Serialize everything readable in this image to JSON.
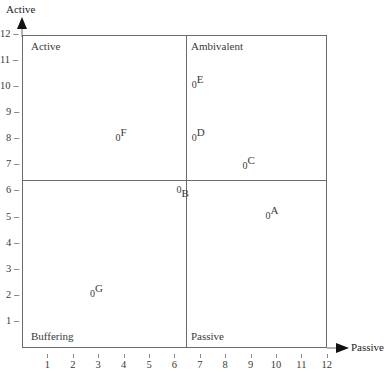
{
  "chart_data": {
    "type": "scatter",
    "title": "",
    "xlabel": "Passive",
    "ylabel": "Active",
    "xlim": [
      0,
      12
    ],
    "ylim": [
      0,
      12
    ],
    "x_ticks": [
      "1",
      "2",
      "3",
      "4",
      "5",
      "6",
      "7",
      "8",
      "9",
      "10",
      "11",
      "12"
    ],
    "y_ticks": [
      "1",
      "2",
      "3",
      "4",
      "5",
      "6",
      "7",
      "8",
      "9",
      "10",
      "11",
      "12"
    ],
    "grid": false,
    "dividers": {
      "x": 6.5,
      "y": 6.5
    },
    "quadrants": [
      {
        "name": "Active",
        "position": "top-left"
      },
      {
        "name": "Ambivalent",
        "position": "top-right"
      },
      {
        "name": "Buffering",
        "position": "bottom-left"
      },
      {
        "name": "Passive",
        "position": "bottom-right"
      }
    ],
    "points": [
      {
        "label": "A",
        "x": 9.7,
        "y": 5.1,
        "sub": "super"
      },
      {
        "label": "B",
        "x": 6.2,
        "y": 6.1,
        "sub": "sub"
      },
      {
        "label": "C",
        "x": 8.8,
        "y": 7.0,
        "sub": "super"
      },
      {
        "label": "D",
        "x": 6.8,
        "y": 8.1,
        "sub": "super"
      },
      {
        "label": "E",
        "x": 6.8,
        "y": 10.1,
        "sub": "super"
      },
      {
        "label": "F",
        "x": 3.8,
        "y": 8.1,
        "sub": "super"
      },
      {
        "label": "G",
        "x": 2.8,
        "y": 2.1,
        "sub": "super"
      }
    ],
    "point_marker": "0"
  },
  "axes": {
    "y_label": "Active",
    "x_label": "Passive"
  },
  "quadrant_labels": {
    "top_left": "Active",
    "top_right": "Ambivalent",
    "bottom_left": "Buffering",
    "bottom_right": "Passive"
  }
}
